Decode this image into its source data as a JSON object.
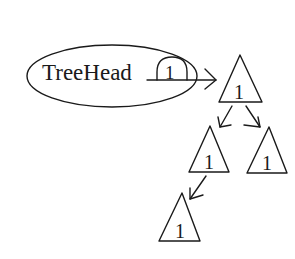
{
  "diagram": {
    "head": {
      "label": "TreeHead",
      "count": "1"
    },
    "nodes": [
      {
        "id": "root",
        "label": "1"
      },
      {
        "id": "left",
        "label": "1"
      },
      {
        "id": "right",
        "label": "1"
      },
      {
        "id": "left-left",
        "label": "1"
      }
    ],
    "colors": {
      "stroke": "#1a1a1a",
      "background": "#ffffff"
    }
  }
}
